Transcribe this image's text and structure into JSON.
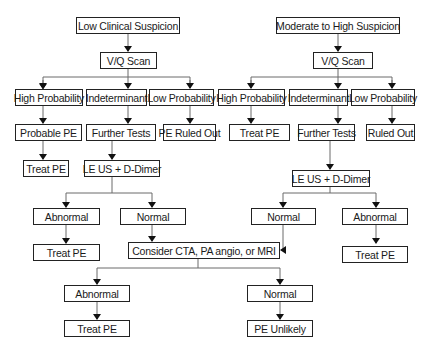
{
  "left": {
    "start": "Low Clinical Suspicion",
    "scan": "V/Q Scan",
    "results": [
      "High Probability",
      "Indeterminant",
      "Low Probability"
    ],
    "high": "Probable PE",
    "high_action": "Treat PE",
    "indeterminant": "Further Tests",
    "low": "PE Ruled Out",
    "tests": "LE US + D-Dimer",
    "abnormal": "Abnormal",
    "abnormal_action": "Treat PE",
    "normal": "Normal"
  },
  "right": {
    "start": "Moderate to High Suspicion",
    "scan": "V/Q Scan",
    "results": [
      "High Probability",
      "Indeterminant",
      "Low Probability"
    ],
    "high": "Treat PE",
    "indeterminant": "Further Tests",
    "low": "Ruled Out",
    "tests": "LE US + D-Dimer",
    "normal": "Normal",
    "abnormal": "Abnormal",
    "abnormal_action": "Treat PE"
  },
  "shared": {
    "consider": "Consider CTA, PA angio, or MRI",
    "abnormal": "Abnormal",
    "abnormal_action": "Treat PE",
    "normal": "Normal",
    "normal_action": "PE Unlikely"
  }
}
